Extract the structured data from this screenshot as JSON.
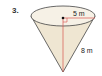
{
  "problem": {
    "number": "3.",
    "figure": "cone",
    "radius_label": "5 m",
    "height_label": "8 m"
  },
  "colors": {
    "fill": "#f3ecdc",
    "outline": "#333333",
    "measure_line": "#d9534f"
  }
}
